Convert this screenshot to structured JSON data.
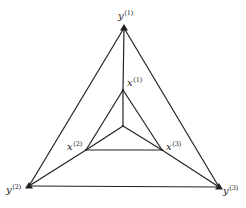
{
  "diagram": {
    "type": "nested-triangle-graph",
    "colors": {
      "line": "#222222",
      "background": "#ffffff"
    },
    "outer_nodes": [
      {
        "id": "y1",
        "base": "y",
        "sup": "(1)",
        "x": 124,
        "y": 28,
        "label_x": 118,
        "label_y": 19
      },
      {
        "id": "y2",
        "base": "y",
        "sup": "(2)",
        "x": 29,
        "y": 186,
        "label_x": 6,
        "label_y": 193
      },
      {
        "id": "y3",
        "base": "y",
        "sup": "(3)",
        "x": 219,
        "y": 187,
        "label_x": 223,
        "label_y": 194
      }
    ],
    "inner_nodes": [
      {
        "id": "x1",
        "base": "x",
        "sup": "(1)",
        "x": 123,
        "y": 90,
        "label_x": 127,
        "label_y": 86
      },
      {
        "id": "x2",
        "base": "x",
        "sup": "(2)",
        "x": 86,
        "y": 150,
        "label_x": 67,
        "label_y": 150
      },
      {
        "id": "x3",
        "base": "x",
        "sup": "(3)",
        "x": 162,
        "y": 150,
        "label_x": 166,
        "label_y": 150
      }
    ],
    "center": {
      "x": 123,
      "y": 126
    },
    "edges": [
      [
        "y1",
        "y2"
      ],
      [
        "y2",
        "y3"
      ],
      [
        "y3",
        "y1"
      ],
      [
        "x1",
        "x2"
      ],
      [
        "x2",
        "x3"
      ],
      [
        "x3",
        "x1"
      ],
      [
        "x1",
        "y1"
      ],
      [
        "x2",
        "y2"
      ],
      [
        "x3",
        "y3"
      ],
      [
        "center",
        "x1"
      ],
      [
        "center",
        "x2"
      ],
      [
        "center",
        "x3"
      ]
    ]
  }
}
